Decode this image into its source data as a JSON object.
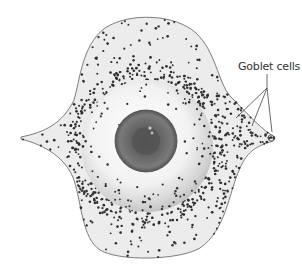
{
  "figure": {
    "labels": [
      {
        "text": "Goblet cells",
        "target": "nasal conjunctiva dense goblet cells"
      }
    ]
  },
  "colors": {
    "background": "#ffffff",
    "conjunctiva_fill": "#ededed",
    "outline": "#6b6b6b",
    "dots": "#2e2e2e",
    "iris": "#5a5a5a",
    "pupil": "#4a4a4a"
  }
}
